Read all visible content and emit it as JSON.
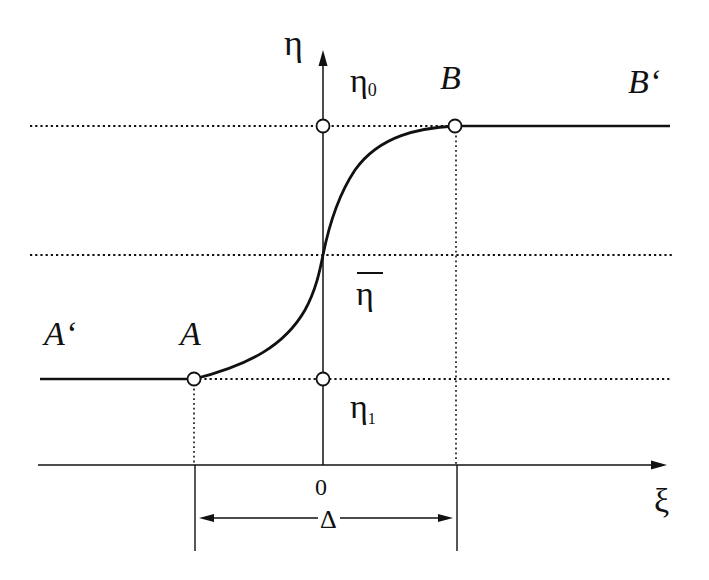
{
  "diagram": {
    "type": "sigmoid-transition",
    "axes": {
      "vertical_label": "η",
      "horizontal_label": "ξ",
      "origin_label": "0"
    },
    "levels": {
      "upper_label": "η",
      "upper_subscript": "0",
      "middle_label": "η̄",
      "middle_base": "η",
      "lower_label": "η",
      "lower_subscript": "1"
    },
    "points": {
      "A": "A",
      "A_prime": "A‘",
      "B": "B",
      "B_prime": "B‘"
    },
    "width_label": "Δ",
    "colors": {
      "ink": "#111111",
      "background": "#ffffff"
    }
  }
}
